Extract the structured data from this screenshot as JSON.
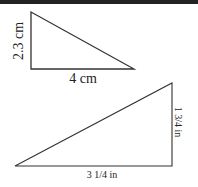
{
  "colors": {
    "stroke": "#333333",
    "text": "#222222",
    "topbar": "#222222",
    "background": "#ffffff"
  },
  "triangles": [
    {
      "id": "triangle-cm",
      "vertices": [
        [
          31,
          12
        ],
        [
          31,
          69
        ],
        [
          134,
          69
        ]
      ],
      "labels": {
        "vertical_leg": "2.3 cm",
        "horizontal_leg": "4 cm"
      }
    },
    {
      "id": "triangle-in",
      "vertices": [
        [
          15,
          166
        ],
        [
          172,
          166
        ],
        [
          172,
          83
        ]
      ],
      "labels": {
        "vertical_leg": "1 3/4 in",
        "horizontal_leg": "3 1/4 in"
      }
    }
  ]
}
